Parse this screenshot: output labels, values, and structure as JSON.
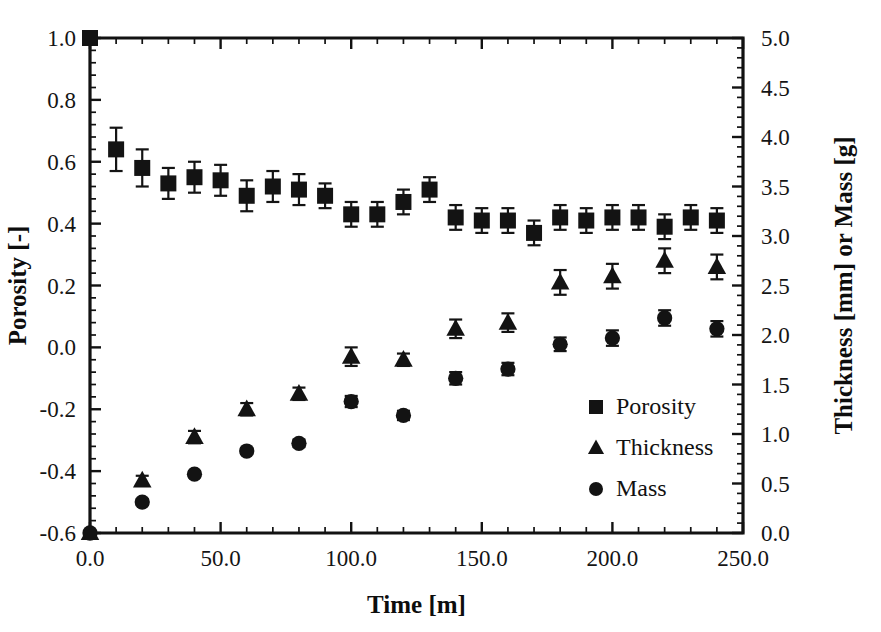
{
  "chart_data": {
    "type": "scatter",
    "title": "",
    "xlabel": "Time [m]",
    "ylabel": "Porosity [-]",
    "y2label": "Thickness [mm] or Mass [g]",
    "xlim": [
      0,
      250
    ],
    "ylim": [
      -0.6,
      1.0
    ],
    "y2lim": [
      0.0,
      5.0
    ],
    "xticks": [
      "0.0",
      "50.0",
      "100.0",
      "150.0",
      "200.0",
      "250.0"
    ],
    "xtick_values": [
      0,
      50,
      100,
      150,
      200,
      250
    ],
    "yticks": [
      "-0.6",
      "-0.4",
      "-0.2",
      "0.0",
      "0.2",
      "0.4",
      "0.6",
      "0.8",
      "1.0"
    ],
    "ytick_values": [
      -0.6,
      -0.4,
      -0.2,
      0.0,
      0.2,
      0.4,
      0.6,
      0.8,
      1.0
    ],
    "y2ticks": [
      "0.0",
      "0.5",
      "1.0",
      "1.5",
      "2.0",
      "2.5",
      "3.0",
      "3.5",
      "4.0",
      "4.5",
      "5.0"
    ],
    "y2tick_values": [
      0.0,
      0.5,
      1.0,
      1.5,
      2.0,
      2.5,
      3.0,
      3.5,
      4.0,
      4.5,
      5.0
    ],
    "minor_ticks_per_interval": 5,
    "grid": false,
    "legend_position": "right-middle",
    "marker_color": "#131313",
    "series": [
      {
        "name": "Porosity",
        "marker": "square",
        "axis": "left",
        "x": [
          0,
          10,
          20,
          30,
          40,
          50,
          60,
          70,
          80,
          90,
          100,
          110,
          120,
          130,
          140,
          150,
          160,
          170,
          180,
          190,
          200,
          210,
          220,
          230,
          240
        ],
        "y": [
          1.0,
          0.64,
          0.58,
          0.53,
          0.55,
          0.54,
          0.49,
          0.52,
          0.51,
          0.49,
          0.43,
          0.43,
          0.47,
          0.51,
          0.42,
          0.41,
          0.41,
          0.37,
          0.42,
          0.41,
          0.42,
          0.42,
          0.39,
          0.42,
          0.41
        ],
        "yerr": [
          0.0,
          0.07,
          0.06,
          0.05,
          0.05,
          0.05,
          0.05,
          0.05,
          0.05,
          0.04,
          0.04,
          0.04,
          0.04,
          0.04,
          0.04,
          0.04,
          0.04,
          0.04,
          0.04,
          0.04,
          0.04,
          0.04,
          0.04,
          0.04,
          0.04
        ]
      },
      {
        "name": "Thickness",
        "marker": "triangle",
        "axis": "left",
        "x": [
          0,
          20,
          40,
          60,
          80,
          100,
          120,
          140,
          160,
          180,
          200,
          220,
          240
        ],
        "y": [
          -0.6,
          -0.43,
          -0.29,
          -0.2,
          -0.15,
          -0.03,
          -0.04,
          0.06,
          0.08,
          0.21,
          0.23,
          0.28,
          0.26
        ],
        "yerr": [
          0.0,
          0.015,
          0.02,
          0.02,
          0.02,
          0.03,
          0.02,
          0.03,
          0.03,
          0.04,
          0.04,
          0.04,
          0.04
        ]
      },
      {
        "name": "Mass",
        "marker": "circle",
        "axis": "left",
        "x": [
          0,
          20,
          40,
          60,
          80,
          100,
          120,
          140,
          160,
          180,
          200,
          220,
          240
        ],
        "y": [
          -0.6,
          -0.5,
          -0.41,
          -0.335,
          -0.31,
          -0.175,
          -0.22,
          -0.1,
          -0.07,
          0.01,
          0.03,
          0.095,
          0.06
        ],
        "yerr": [
          0.0,
          0.01,
          0.01,
          0.01,
          0.012,
          0.018,
          0.015,
          0.02,
          0.02,
          0.022,
          0.025,
          0.025,
          0.025
        ]
      }
    ],
    "legend": [
      {
        "label": "Porosity",
        "marker": "square"
      },
      {
        "label": "Thickness",
        "marker": "triangle"
      },
      {
        "label": "Mass",
        "marker": "circle"
      }
    ]
  }
}
